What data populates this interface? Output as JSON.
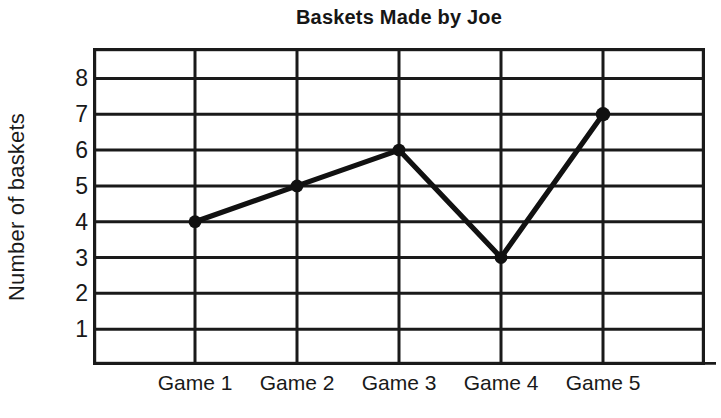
{
  "chart_data": {
    "type": "line",
    "title": "Baskets Made by Joe",
    "xlabel": "",
    "ylabel": "Number of baskets",
    "categories": [
      "Game 1",
      "Game 2",
      "Game 3",
      "Game 4",
      "Game 5"
    ],
    "values": [
      4,
      5,
      6,
      3,
      7
    ],
    "series": [
      {
        "name": "Baskets Made by Joe",
        "values": [
          4,
          5,
          6,
          3,
          7
        ]
      }
    ],
    "ylim": [
      0,
      8.85
    ],
    "yticks": [
      8,
      7,
      6,
      5,
      4,
      3,
      2,
      1
    ],
    "ytick_labels": [
      "8",
      "7",
      "6",
      "5",
      "4",
      "3",
      "2",
      "1"
    ],
    "grid": true,
    "grid_color": "#1a1a1a",
    "legend": false,
    "legend_position": "none",
    "line_color": "#111111",
    "marker": "filled-circle",
    "marker_color": "#111111",
    "background": "#ffffff",
    "points": [
      {
        "category": "Game 1",
        "value": 4
      },
      {
        "category": "Game 2",
        "value": 5
      },
      {
        "category": "Game 3",
        "value": 6
      },
      {
        "category": "Game 4",
        "value": 3
      },
      {
        "category": "Game 5",
        "value": 7
      }
    ]
  }
}
